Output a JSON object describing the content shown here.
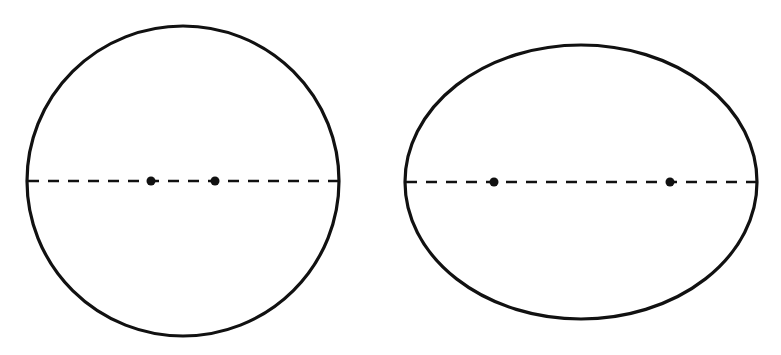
{
  "diagram": {
    "colors": {
      "stroke": "#111111",
      "background": "#ffffff"
    },
    "figures": [
      {
        "name": "circle",
        "center": [
          183,
          181
        ],
        "rx": 156,
        "ry": 155,
        "axis": {
          "x1": 27,
          "x2": 340,
          "y": 181,
          "style": "dashed"
        },
        "foci": [
          [
            151,
            181
          ],
          [
            215,
            181
          ]
        ]
      },
      {
        "name": "ellipse",
        "center": [
          581,
          182
        ],
        "rx": 176,
        "ry": 137,
        "axis": {
          "x1": 405,
          "x2": 757,
          "y": 182,
          "style": "dashed"
        },
        "foci": [
          [
            494,
            182
          ],
          [
            670,
            182
          ]
        ]
      }
    ]
  }
}
